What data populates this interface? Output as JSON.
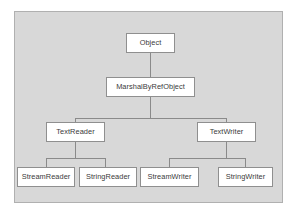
{
  "diagram": {
    "type": "class-hierarchy-tree",
    "panel": {
      "background_color": "#d8d8d8",
      "border_color": "#b0b0b0"
    },
    "node_style": {
      "fill_color": "#ffffff",
      "border_color": "#8f8f8f",
      "text_color": "#3a3a3a"
    },
    "connector_color": "#8a8a8a",
    "levels": [
      {
        "level": 1,
        "nodes": [
          "Object"
        ]
      },
      {
        "level": 2,
        "nodes": [
          "MarshalByRefObject"
        ]
      },
      {
        "level": 3,
        "nodes": [
          "TextReader",
          "TextWriter"
        ]
      },
      {
        "level": 4,
        "nodes": [
          "StreamReader",
          "StringReader",
          "StreamWriter",
          "StringWriter"
        ]
      }
    ],
    "nodes": {
      "object": "Object",
      "marshal_by_ref_object": "MarshalByRefObject",
      "text_reader": "TextReader",
      "text_writer": "TextWriter",
      "stream_reader": "StreamReader",
      "string_reader": "StringReader",
      "stream_writer": "StreamWriter",
      "string_writer": "StringWriter"
    },
    "edges": [
      {
        "from": "Object",
        "to": "MarshalByRefObject"
      },
      {
        "from": "MarshalByRefObject",
        "to": "TextReader"
      },
      {
        "from": "MarshalByRefObject",
        "to": "TextWriter"
      },
      {
        "from": "TextReader",
        "to": "StreamReader"
      },
      {
        "from": "TextReader",
        "to": "StringReader"
      },
      {
        "from": "TextWriter",
        "to": "StreamWriter"
      },
      {
        "from": "TextWriter",
        "to": "StringWriter"
      }
    ]
  }
}
